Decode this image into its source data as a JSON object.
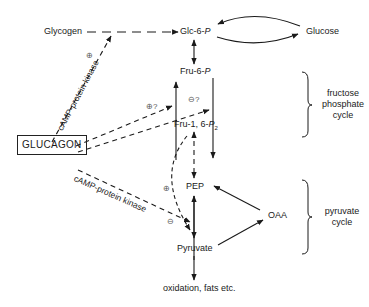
{
  "nodes": {
    "glycogen": "Glycogen",
    "glc6p": "Glc-6-",
    "glc6p_p": "P",
    "glucose": "Glucose",
    "fru6p": "Fru-6-",
    "fru6p_p": "P",
    "fru16p2": "Fru-1, 6-",
    "fru16p2_p": "P",
    "fru16p2_sub": "2",
    "pep": "PEP",
    "oaa": "OAA",
    "pyruvate": "Pyruvate",
    "oxidation": "oxidation, fats etc.",
    "glucagon": "GLUCAGON"
  },
  "cycles": {
    "fructose_phosphate": [
      "fructose",
      "phosphate",
      "cycle"
    ],
    "pyruvate": [
      "pyruvate",
      "cycle"
    ]
  },
  "regulation": {
    "kinase_upper": "cAMP-protein kinase",
    "kinase_lower": "cAMP-protein kinase",
    "plus": "⊕",
    "minus": "⊖",
    "plus_q": "⊕?",
    "minus_q": "⊖?"
  },
  "colors": {
    "ink": "#1a1a1a",
    "sign": "#555555"
  }
}
